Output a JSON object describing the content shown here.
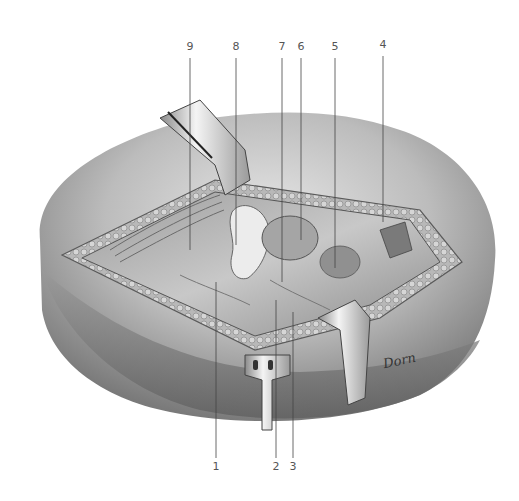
{
  "figure": {
    "type": "surgical anatomical illustration",
    "style": "grayscale pencil rendering",
    "signature": "Dorn",
    "callouts_top": [
      {
        "number": "9",
        "x": 190,
        "label_y": 52,
        "line_start": 58,
        "line_end": 250
      },
      {
        "number": "8",
        "x": 236,
        "label_y": 52,
        "line_start": 58,
        "line_end": 245
      },
      {
        "number": "7",
        "x": 282,
        "label_y": 52,
        "line_start": 58,
        "line_end": 282
      },
      {
        "number": "6",
        "x": 301,
        "label_y": 52,
        "line_start": 58,
        "line_end": 240
      },
      {
        "number": "5",
        "x": 335,
        "label_y": 52,
        "line_start": 58,
        "line_end": 268
      },
      {
        "number": "4",
        "x": 383,
        "label_y": 50,
        "line_start": 56,
        "line_end": 222
      }
    ],
    "callouts_bottom": [
      {
        "number": "1",
        "x": 216,
        "label_y": 470,
        "line_start": 282,
        "line_end": 458
      },
      {
        "number": "2",
        "x": 276,
        "label_y": 470,
        "line_start": 300,
        "line_end": 458
      },
      {
        "number": "3",
        "x": 293,
        "label_y": 470,
        "line_start": 312,
        "line_end": 458
      }
    ],
    "colors": {
      "background": "#ffffff",
      "skin_light": "#d9d9d9",
      "skin_mid": "#a8a8a8",
      "skin_dark": "#6e6e6e",
      "fat_layer": "#bdbdbd",
      "tissue": "#8c8c8c",
      "retractor_metal": "#e8e8e8",
      "leader_line": "#444444"
    }
  }
}
